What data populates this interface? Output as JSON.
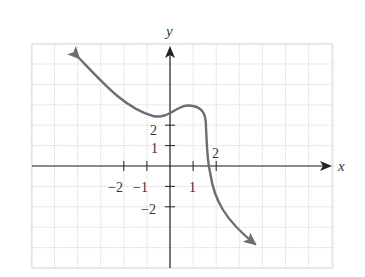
{
  "chart_data": {
    "type": "line",
    "title": "",
    "xlabel": "x",
    "ylabel": "y",
    "grid": true,
    "xlim": [
      -6,
      7
    ],
    "ylim": [
      -5,
      6
    ],
    "x_ticks": [
      {
        "value": -2,
        "label": "−2"
      },
      {
        "value": -1,
        "label": "−1"
      },
      {
        "value": 1,
        "label": "1"
      },
      {
        "value": 2,
        "label": "2"
      }
    ],
    "y_ticks": [
      {
        "value": 2,
        "label": "2"
      },
      {
        "value": 1,
        "label": "1"
      },
      {
        "value": -2,
        "label": "−2"
      }
    ],
    "series": [
      {
        "name": "f(x)",
        "color": "#6e6e6e",
        "arrow_both_ends": true,
        "points": [
          [
            -4.0,
            5.4
          ],
          [
            -3.0,
            4.0
          ],
          [
            -2.0,
            3.0
          ],
          [
            -1.0,
            2.5
          ],
          [
            -0.6,
            2.45
          ],
          [
            0.0,
            2.7
          ],
          [
            0.5,
            3.0
          ],
          [
            0.9,
            3.0
          ],
          [
            1.3,
            2.6
          ],
          [
            1.5,
            2.0
          ],
          [
            1.6,
            1.0
          ],
          [
            1.7,
            0.0
          ],
          [
            1.85,
            -1.0
          ],
          [
            2.2,
            -2.2
          ],
          [
            2.8,
            -3.5
          ],
          [
            3.7,
            -4.8
          ]
        ]
      }
    ]
  },
  "labels": {
    "x_axis": "x",
    "y_axis": "y",
    "x_neg2": "−2",
    "x_neg1": "−1",
    "x_pos1": "1",
    "x_pos2": "2",
    "y_pos2": "2",
    "y_pos1": "1",
    "y_neg2": "−2"
  }
}
